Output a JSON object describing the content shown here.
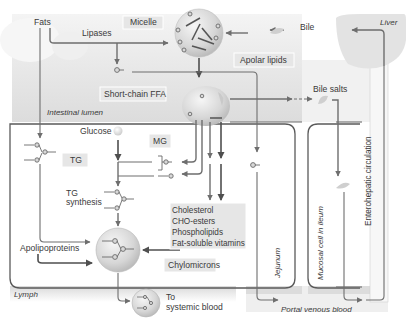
{
  "diagram": {
    "colors": {
      "background": "#ffffff",
      "lumen_fill": "#e4e4e4",
      "cell_fill": "#efefef",
      "label_box": "#e6e6e6",
      "arrow": "#6e6e6e",
      "arrow_dark": "#4f4f4f",
      "text": "#3a3a3a"
    },
    "labels": {
      "fats": "Fats",
      "lipases": "Lipases",
      "micelle": "Micelle",
      "apolar_lipids": "Apolar lipids",
      "bile": "Bile",
      "liver": "Liver",
      "short_chain_ffa": "Short-chain FFA",
      "intestinal_lumen": "Intestinal lumen",
      "bile_salts": "Bile salts",
      "glucose": "Glucose",
      "mg": "MG",
      "tg": "TG",
      "tg_synthesis_line1": "TG",
      "tg_synthesis_line2": "synthesis",
      "cholesterol": "Cholesterol",
      "cho_esters": "CHO-esters",
      "phospholipids": "Phospholipids",
      "fat_soluble_vitamins": "Fat-soluble vitamins",
      "apolipoproteins": "Apolipoproteins",
      "chylomicrons": "Chylomicrons",
      "lymph": "Lymph",
      "to_systemic_line1": "To",
      "to_systemic_line2": "systemic blood",
      "jejunum": "Jejunum",
      "mucosal_cell_ileum": "Mucosal cell in ileum",
      "enterohepatic_circulation": "Enterohepatic circulation",
      "portal_venous_blood": "Portal venous blood"
    },
    "icons": {
      "micelle": "micelle-sphere-icon",
      "bile_drop": "bile-droplet-icon",
      "liver": "liver-shape-icon",
      "glucose": "glucose-sphere-icon",
      "fatty_acid": "fatty-acid-molecule-icon",
      "triglyceride": "triglyceride-molecule-icon",
      "chylomicron": "chylomicron-sphere-icon"
    }
  }
}
